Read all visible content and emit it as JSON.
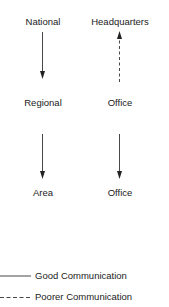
{
  "diagram": {
    "nodes": {
      "national": "National",
      "headquarters": "Headquarters",
      "regional": "Regional",
      "office_mid": "Office",
      "area": "Area",
      "office_bottom": "Office"
    },
    "edges": [
      {
        "from": "National",
        "to": "Regional",
        "style": "solid",
        "direction": "down"
      },
      {
        "from": "Office",
        "to": "Headquarters",
        "style": "dashed",
        "direction": "up"
      },
      {
        "from": "Regional",
        "to": "Area",
        "style": "solid",
        "direction": "down"
      },
      {
        "from": "Office",
        "to": "Office",
        "style": "solid",
        "direction": "down"
      }
    ],
    "legend": {
      "good": "Good Communication",
      "poorer": "Poorer Communication"
    }
  }
}
